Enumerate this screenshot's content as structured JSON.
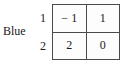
{
  "figure": {
    "player_label": "Blue",
    "row_labels": [
      "1",
      "2"
    ],
    "matrix": {
      "rows": [
        {
          "cells": [
            "− 1",
            "1"
          ]
        },
        {
          "cells": [
            "2",
            "0"
          ]
        }
      ]
    },
    "colors": {
      "text": "#1a1a1a",
      "border": "#4a4a4a",
      "cell_background": "#fdfdfd",
      "page_background": "#ffffff"
    }
  }
}
